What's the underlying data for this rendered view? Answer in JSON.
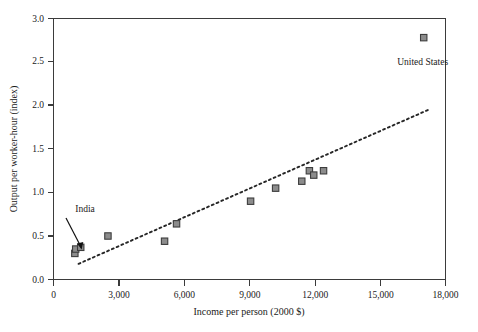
{
  "chart_data": {
    "type": "scatter",
    "title": "",
    "subtitle": "",
    "xlabel": "Income per person (2000 $)",
    "ylabel": "Output per worker-hour (index)",
    "xlim": [
      0,
      18000
    ],
    "ylim": [
      0.0,
      3.0
    ],
    "xticks": [
      0,
      3000,
      6000,
      9000,
      12000,
      15000,
      18000
    ],
    "xtick_labels": [
      "0",
      "3,000",
      "6,000",
      "9,000",
      "12,000",
      "15,000",
      "18,000"
    ],
    "yticks": [
      0.0,
      0.5,
      1.0,
      1.5,
      2.0,
      2.5,
      3.0
    ],
    "ytick_labels": [
      "0.0",
      "0.5",
      "1.0",
      "1.5",
      "2.0",
      "2.5",
      "3.0"
    ],
    "grid": false,
    "legend": false,
    "legend_position": "none",
    "marker_shape": "square",
    "marker_fill_color": "#8c8c8c",
    "marker_edge_color": "#3d3d3d",
    "points": [
      {
        "x": 980,
        "y": 0.3,
        "label": ""
      },
      {
        "x": 1020,
        "y": 0.35,
        "label": "India"
      },
      {
        "x": 1250,
        "y": 0.37,
        "label": ""
      },
      {
        "x": 2500,
        "y": 0.5,
        "label": ""
      },
      {
        "x": 5100,
        "y": 0.44,
        "label": ""
      },
      {
        "x": 5650,
        "y": 0.64,
        "label": ""
      },
      {
        "x": 9050,
        "y": 0.9,
        "label": ""
      },
      {
        "x": 10200,
        "y": 1.05,
        "label": ""
      },
      {
        "x": 11400,
        "y": 1.13,
        "label": ""
      },
      {
        "x": 11750,
        "y": 1.25,
        "label": ""
      },
      {
        "x": 11950,
        "y": 1.2,
        "label": ""
      },
      {
        "x": 12400,
        "y": 1.25,
        "label": ""
      },
      {
        "x": 17000,
        "y": 2.78,
        "label": "United States"
      }
    ],
    "trend_line": {
      "style": "dotted",
      "color": "#262626",
      "x_start": 1150,
      "y_start": 0.18,
      "x_end": 17300,
      "y_end": 1.96
    },
    "annotations": [
      {
        "text": "India",
        "label_x": 1000,
        "label_y": 0.78,
        "target_x": 1080,
        "target_y": 0.42
      },
      {
        "text": "United States",
        "label_x": 16950,
        "label_y": 2.47,
        "target_x": null,
        "target_y": null
      }
    ]
  },
  "axes": {
    "x_title": "Income per person (2000 $)",
    "y_title": "Output per worker-hour (index)",
    "x_tick_labels": [
      "0",
      "3,000",
      "6,000",
      "9,000",
      "12,000",
      "15,000",
      "18,000"
    ],
    "y_tick_labels": [
      "0.0",
      "0.5",
      "1.0",
      "1.5",
      "2.0",
      "2.5",
      "3.0"
    ]
  },
  "annotations": {
    "india": "India",
    "united_states": "United States"
  }
}
